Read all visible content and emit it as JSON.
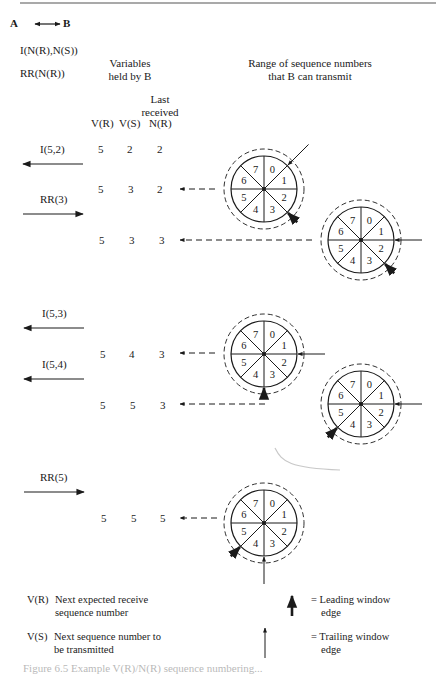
{
  "legend_top": {
    "direction": "A ↔ B",
    "a_label": "A",
    "b_label": "B",
    "frame_i": "I(N(R),N(S))",
    "frame_rr": "RR(N(R))"
  },
  "headers": {
    "variables_line1": "Variables",
    "variables_line2": "held by B",
    "range_line1": "Range of sequence numbers",
    "range_line2": "that B can transmit",
    "last_line1": "Last",
    "last_line2": "received",
    "col_vr": "V(R)",
    "col_vs": "V(S)",
    "col_nr": "N(R)"
  },
  "frames": [
    {
      "label": "I(5,2)",
      "direction": "left"
    },
    {
      "label": "RR(3)",
      "direction": "right"
    },
    {
      "label": "I(5,3)",
      "direction": "left"
    },
    {
      "label": "I(5,4)",
      "direction": "left"
    },
    {
      "label": "RR(5)",
      "direction": "right"
    }
  ],
  "rows": [
    {
      "vr": "5",
      "vs": "2",
      "nr": "2"
    },
    {
      "vr": "5",
      "vs": "3",
      "nr": "2"
    },
    {
      "vr": "5",
      "vs": "3",
      "nr": "3"
    },
    {
      "vr": "5",
      "vs": "4",
      "nr": "3"
    },
    {
      "vr": "5",
      "vs": "5",
      "nr": "3"
    },
    {
      "vr": "5",
      "vs": "5",
      "nr": "5"
    }
  ],
  "wheel_sectors": [
    "0",
    "1",
    "2",
    "3",
    "4",
    "5",
    "6",
    "7"
  ],
  "key": {
    "vr_term": "V(R)",
    "vr_def1": "Next expected receive",
    "vr_def2": "sequence number",
    "vs_term": "V(S)",
    "vs_def1": "Next sequence number to",
    "vs_def2": "be transmitted",
    "leading1": "= Leading window",
    "leading2": "edge",
    "trailing1": "= Trailing window",
    "trailing2": "edge"
  },
  "caption": "Figure 6.5  Example V(R)/N(R) sequence numbering..."
}
